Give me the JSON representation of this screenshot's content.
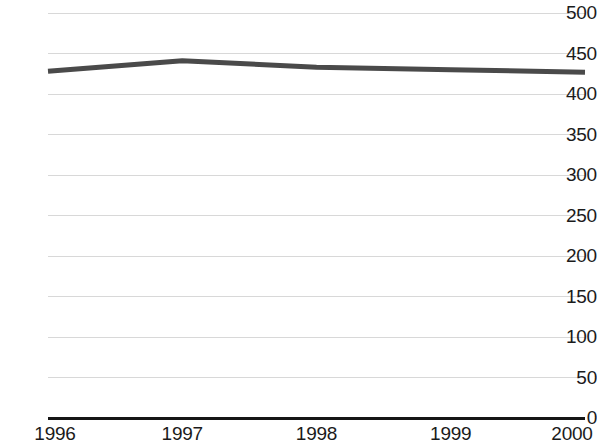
{
  "chart_data": {
    "type": "line",
    "title": "",
    "subtitle": "",
    "xlabel": "",
    "ylabel": "",
    "categories": [
      "1996",
      "1997",
      "1998",
      "1999",
      "2000"
    ],
    "x": [
      1996,
      1997,
      1998,
      1999,
      2000
    ],
    "series": [
      {
        "name": "",
        "values": [
          428,
          441,
          433,
          430,
          427
        ],
        "color": "#4a4a4a",
        "line_width": 5
      }
    ],
    "values": [
      428,
      441,
      433,
      430,
      427
    ],
    "ylim": [
      0,
      500
    ],
    "xlim": [
      1996,
      2000
    ],
    "y_ticks": [
      0,
      50,
      100,
      150,
      200,
      250,
      300,
      350,
      400,
      450,
      500
    ],
    "y_tick_labels": [
      "0",
      "50",
      "100",
      "150",
      "200",
      "250",
      "300",
      "350",
      "400",
      "450",
      "500"
    ],
    "x_tick_labels": [
      "1996",
      "1997",
      "1998",
      "1999",
      "2000"
    ],
    "grid": true,
    "grid_axis": "y",
    "grid_color": "#d8d8d8",
    "legend": false,
    "legend_position": "none",
    "axis_color": "#151515",
    "background_color": "#ffffff",
    "text_color": "#1b1b1b"
  },
  "plot_geometry": {
    "left": 48,
    "right": 585,
    "top": 13,
    "bottom": 418
  }
}
